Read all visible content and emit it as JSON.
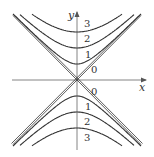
{
  "chart_data": {
    "type": "contour",
    "title": "",
    "xlabel": "x",
    "ylabel": "y",
    "grid": false,
    "legend": false,
    "levels_upper": [
      {
        "label": "3",
        "value": 3
      },
      {
        "label": "2",
        "value": 2
      },
      {
        "label": "1",
        "value": 1
      },
      {
        "label": "0",
        "value": 0
      }
    ],
    "levels_lower": [
      {
        "label": "0",
        "value": 0
      },
      {
        "label": "1",
        "value": 1
      },
      {
        "label": "2",
        "value": 2
      },
      {
        "label": "3",
        "value": 3
      }
    ],
    "asymptotes": [
      "y = x",
      "y = -x"
    ]
  },
  "axes": {
    "x_label": "x",
    "y_label": "y"
  },
  "labels": {
    "upper": [
      "3",
      "2",
      "1",
      "0"
    ],
    "lower": [
      "0",
      "1",
      "2",
      "3"
    ]
  },
  "colors": {
    "curve": "#3a3a3a",
    "axis": "#6a6a6a",
    "text": "#333333"
  }
}
